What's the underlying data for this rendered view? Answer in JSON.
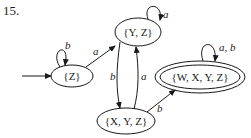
{
  "problem_number": "15.",
  "automaton": {
    "start_state": "{Z}",
    "accepting_states": [
      "{W, X, Y, Z}"
    ],
    "states": [
      {
        "id": "Z",
        "label": "{Z}"
      },
      {
        "id": "YZ",
        "label": "{Y, Z}"
      },
      {
        "id": "XYZ",
        "label": "{X, Y, Z}"
      },
      {
        "id": "WXYZ",
        "label": "{W, X, Y, Z}"
      }
    ],
    "transitions": [
      {
        "from": "Z",
        "to": "Z",
        "label": "b"
      },
      {
        "from": "Z",
        "to": "YZ",
        "label": "a"
      },
      {
        "from": "YZ",
        "to": "YZ",
        "label": "a"
      },
      {
        "from": "YZ",
        "to": "XYZ",
        "label": "b"
      },
      {
        "from": "XYZ",
        "to": "YZ",
        "label": "a"
      },
      {
        "from": "XYZ",
        "to": "WXYZ",
        "label": "b"
      },
      {
        "from": "WXYZ",
        "to": "WXYZ",
        "label": "a, b"
      }
    ]
  },
  "colors": {
    "ink": "#1a1a1a",
    "background": "#ffffff"
  }
}
